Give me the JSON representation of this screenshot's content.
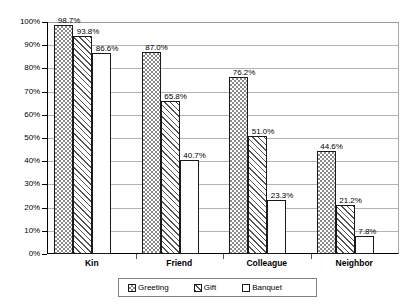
{
  "chart_data": {
    "type": "bar",
    "title": "",
    "subtitle": "",
    "xlabel": "",
    "ylabel": "",
    "categories": [
      "Kin",
      "Friend",
      "Colleague",
      "Neighbor"
    ],
    "series": [
      {
        "name": "Greeting",
        "pattern": "checkerboard",
        "values": [
          98.7,
          87.0,
          76.2,
          44.6
        ],
        "labels": [
          "98.7%",
          "87.0%",
          "76.2%",
          "44.6%"
        ]
      },
      {
        "name": "Gift",
        "pattern": "diagonal-hatch",
        "values": [
          93.8,
          65.8,
          51.0,
          21.2
        ],
        "labels": [
          "93.8%",
          "65.8%",
          "51.0%",
          "21.2%"
        ]
      },
      {
        "name": "Banquet",
        "pattern": "empty",
        "values": [
          86.6,
          40.7,
          23.3,
          7.8
        ],
        "labels": [
          "86.6%",
          "40.7%",
          "23.3%",
          "7.8%"
        ]
      }
    ],
    "ylim": [
      0,
      100
    ],
    "ytick_values": [
      100,
      90,
      80,
      70,
      60,
      50,
      40,
      30,
      20,
      10,
      0
    ],
    "ytick_labels": [
      "100%",
      "90%",
      "80%",
      "70%",
      "60%",
      "50%",
      "40%",
      "30%",
      "20%",
      "10%",
      "0%"
    ],
    "grid": "horizontal",
    "legend_position": "bottom-center",
    "legend_entries": [
      "Greeting",
      "Gift",
      "Banquet"
    ],
    "colors": {
      "bar_outline": "#1a1a1a",
      "gridline": "#b4b4b4",
      "axis": "#000000",
      "background": "#ffffff",
      "pattern_ink": "#8c8c8c"
    }
  }
}
